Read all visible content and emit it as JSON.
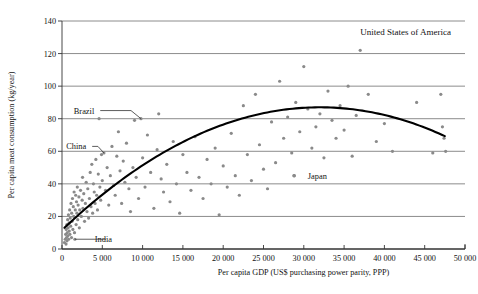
{
  "chart_data": {
    "type": "scatter",
    "title": "",
    "xlabel": "Per capita GDP (US$ purchasing power parity, PPP)",
    "ylabel": "Per capita meat consumption (kg/year)",
    "xlim": [
      0,
      50000
    ],
    "ylim": [
      0,
      140
    ],
    "xticks": [
      0,
      5000,
      10000,
      15000,
      20000,
      25000,
      30000,
      35000,
      40000,
      45000,
      50000
    ],
    "xticklabels": [
      "0",
      "5 000",
      "10 000",
      "15 000",
      "20 000",
      "25 000",
      "30 000",
      "35 000",
      "40 000",
      "45 000",
      "50 000"
    ],
    "yticks": [
      0,
      20,
      40,
      60,
      80,
      100,
      120,
      140
    ],
    "yticklabels": [
      "0",
      "20",
      "40",
      "60",
      "80",
      "100",
      "120",
      "140"
    ],
    "grid": "horizontal",
    "legend": "none",
    "marker_color": "#8a8a8a",
    "trend_color": "#000000",
    "grid_color": "#8c8c8c",
    "trend": {
      "type": "quadratic-fit",
      "peak_x": 32000,
      "peak_y": 87,
      "start": [
        300,
        13
      ],
      "end": [
        47500,
        80
      ]
    },
    "annotations": [
      {
        "label": "United States of America",
        "x": 37000,
        "y": 133,
        "point_x": 37000,
        "point_y": 122,
        "leader": false
      },
      {
        "label": "Brazil",
        "x": 4000,
        "y": 85,
        "point_x": 9800,
        "point_y": 80,
        "leader": true
      },
      {
        "label": "China",
        "x": 3000,
        "y": 63,
        "point_x": 5200,
        "point_y": 59,
        "leader": true
      },
      {
        "label": "Japan",
        "x": 30500,
        "y": 45,
        "point_x": 28800,
        "point_y": 45,
        "leader": false
      },
      {
        "label": "India",
        "x": 6200,
        "y": 6,
        "point_x": 1600,
        "point_y": 6,
        "leader": true
      }
    ],
    "points": [
      [
        300,
        4
      ],
      [
        400,
        6
      ],
      [
        450,
        9
      ],
      [
        500,
        3
      ],
      [
        520,
        12
      ],
      [
        560,
        7
      ],
      [
        600,
        15
      ],
      [
        620,
        5
      ],
      [
        650,
        10
      ],
      [
        700,
        18
      ],
      [
        720,
        8
      ],
      [
        760,
        13
      ],
      [
        800,
        21
      ],
      [
        830,
        6
      ],
      [
        880,
        16
      ],
      [
        900,
        11
      ],
      [
        950,
        24
      ],
      [
        980,
        9
      ],
      [
        1020,
        19
      ],
      [
        1080,
        14
      ],
      [
        1120,
        28
      ],
      [
        1180,
        7
      ],
      [
        1200,
        22
      ],
      [
        1250,
        17
      ],
      [
        1300,
        31
      ],
      [
        1350,
        12
      ],
      [
        1400,
        26
      ],
      [
        1450,
        20
      ],
      [
        1500,
        35
      ],
      [
        1550,
        10
      ],
      [
        1600,
        6
      ],
      [
        1650,
        24
      ],
      [
        1700,
        33
      ],
      [
        1750,
        15
      ],
      [
        1800,
        29
      ],
      [
        1850,
        22
      ],
      [
        1900,
        38
      ],
      [
        1950,
        18
      ],
      [
        2000,
        27
      ],
      [
        2100,
        32
      ],
      [
        2150,
        13
      ],
      [
        2200,
        24
      ],
      [
        2300,
        36
      ],
      [
        2400,
        20
      ],
      [
        2500,
        30
      ],
      [
        2550,
        44
      ],
      [
        2600,
        25
      ],
      [
        2700,
        34
      ],
      [
        2800,
        17
      ],
      [
        2900,
        28
      ],
      [
        3000,
        41
      ],
      [
        3100,
        23
      ],
      [
        3200,
        37
      ],
      [
        3300,
        19
      ],
      [
        3400,
        31
      ],
      [
        3500,
        47
      ],
      [
        3600,
        26
      ],
      [
        3700,
        52
      ],
      [
        3800,
        22
      ],
      [
        3900,
        40
      ],
      [
        4000,
        35
      ],
      [
        4100,
        28
      ],
      [
        4200,
        55
      ],
      [
        4300,
        33
      ],
      [
        4400,
        24
      ],
      [
        4500,
        46
      ],
      [
        4600,
        80
      ],
      [
        4700,
        38
      ],
      [
        4800,
        30
      ],
      [
        4900,
        58
      ],
      [
        5000,
        42
      ],
      [
        5200,
        59
      ],
      [
        5400,
        36
      ],
      [
        5600,
        50
      ],
      [
        5800,
        27
      ],
      [
        6000,
        45
      ],
      [
        6200,
        63
      ],
      [
        6400,
        39
      ],
      [
        6600,
        33
      ],
      [
        6800,
        57
      ],
      [
        7000,
        72
      ],
      [
        7200,
        48
      ],
      [
        7400,
        28
      ],
      [
        7600,
        54
      ],
      [
        7800,
        41
      ],
      [
        8000,
        65
      ],
      [
        8300,
        37
      ],
      [
        8500,
        23
      ],
      [
        8800,
        50
      ],
      [
        9000,
        79
      ],
      [
        9200,
        44
      ],
      [
        9500,
        31
      ],
      [
        9800,
        80
      ],
      [
        10000,
        56
      ],
      [
        10300,
        38
      ],
      [
        10600,
        70
      ],
      [
        11000,
        47
      ],
      [
        11400,
        25
      ],
      [
        11800,
        61
      ],
      [
        12000,
        83
      ],
      [
        12300,
        43
      ],
      [
        12600,
        35
      ],
      [
        13000,
        52
      ],
      [
        13400,
        29
      ],
      [
        13800,
        66
      ],
      [
        14200,
        40
      ],
      [
        14600,
        22
      ],
      [
        15000,
        58
      ],
      [
        15500,
        47
      ],
      [
        16000,
        36
      ],
      [
        16500,
        69
      ],
      [
        17000,
        44
      ],
      [
        17500,
        31
      ],
      [
        18000,
        55
      ],
      [
        18500,
        40
      ],
      [
        19000,
        62
      ],
      [
        19500,
        21
      ],
      [
        20000,
        51
      ],
      [
        20500,
        38
      ],
      [
        21000,
        71
      ],
      [
        21500,
        45
      ],
      [
        22000,
        33
      ],
      [
        22500,
        88
      ],
      [
        23000,
        58
      ],
      [
        23500,
        42
      ],
      [
        24000,
        95
      ],
      [
        24500,
        64
      ],
      [
        25000,
        49
      ],
      [
        25500,
        37
      ],
      [
        26000,
        78
      ],
      [
        26500,
        53
      ],
      [
        27000,
        103
      ],
      [
        27500,
        68
      ],
      [
        28000,
        81
      ],
      [
        28500,
        59
      ],
      [
        28800,
        45
      ],
      [
        29000,
        90
      ],
      [
        29500,
        72
      ],
      [
        30000,
        112
      ],
      [
        30500,
        86
      ],
      [
        31000,
        62
      ],
      [
        31500,
        75
      ],
      [
        32000,
        83
      ],
      [
        32500,
        56
      ],
      [
        33000,
        97
      ],
      [
        33500,
        79
      ],
      [
        34000,
        68
      ],
      [
        34500,
        88
      ],
      [
        35000,
        73
      ],
      [
        35500,
        100
      ],
      [
        36000,
        57
      ],
      [
        36500,
        82
      ],
      [
        37000,
        122
      ],
      [
        38000,
        95
      ],
      [
        39000,
        66
      ],
      [
        40000,
        77
      ],
      [
        41000,
        60
      ],
      [
        44000,
        90
      ],
      [
        46000,
        59
      ],
      [
        47000,
        95
      ],
      [
        47200,
        75
      ],
      [
        47400,
        68
      ],
      [
        47600,
        60
      ]
    ]
  }
}
